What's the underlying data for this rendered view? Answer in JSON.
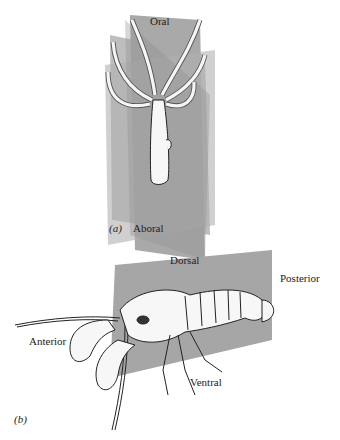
{
  "figure": {
    "panel_a": {
      "tag": "(a)",
      "labels": {
        "top": "Oral",
        "bottom": "Aboral"
      },
      "plane_color": "#9c9c9c",
      "organism": "hydra"
    },
    "panel_b": {
      "tag": "(b)",
      "labels": {
        "top": "Dorsal",
        "right": "Posterior",
        "left": "Anterior",
        "bottom": "Ventral"
      },
      "plane_color": "#a6a6a6",
      "organism": "crayfish"
    }
  }
}
